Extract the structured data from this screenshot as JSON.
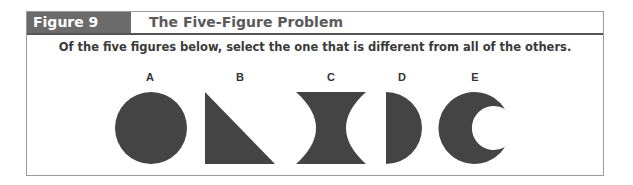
{
  "figure": {
    "label": "Figure 9",
    "title": "The Five-Figure Problem",
    "instruction": "Of the five figures below, select the one that is different from all of the others."
  },
  "shapes": [
    {
      "label": "A",
      "shape": "circle"
    },
    {
      "label": "B",
      "shape": "right-triangle"
    },
    {
      "label": "C",
      "shape": "concave-hourglass"
    },
    {
      "label": "D",
      "shape": "half-disc"
    },
    {
      "label": "E",
      "shape": "crescent"
    }
  ],
  "colors": {
    "shape_fill": "#444444",
    "header_bg": "#6b6b6b",
    "frame_border": "#9a9a9a"
  }
}
